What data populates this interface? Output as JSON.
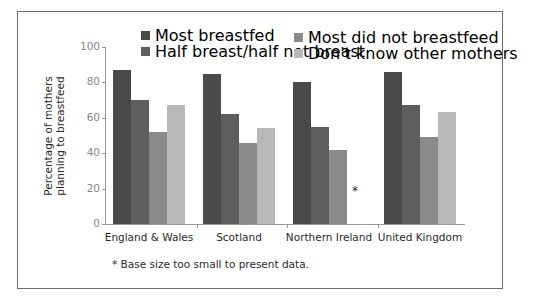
{
  "chart_data": {
    "type": "bar",
    "title": "",
    "xlabel": "",
    "ylabel": "Percentage of mothers planning to breastfeed",
    "ylabel_lines": [
      "Percentage of mothers",
      "planning to breastfeed"
    ],
    "ylim": [
      0,
      100
    ],
    "yticks": [
      0,
      20,
      40,
      60,
      80,
      100
    ],
    "grid": false,
    "legend_position": "top",
    "categories": [
      "England & Wales",
      "Scotland",
      "Northern Ireland",
      "United Kingdom"
    ],
    "series": [
      {
        "name": "Most breastfed",
        "color": "#4a4a4a",
        "values": [
          87,
          85,
          80,
          86
        ]
      },
      {
        "name": "Half breast/half not breast",
        "color": "#5e5e5e",
        "values": [
          70,
          62,
          55,
          67
        ]
      },
      {
        "name": "Most did not breastfeed",
        "color": "#8a8a8a",
        "values": [
          52,
          46,
          42,
          49
        ]
      },
      {
        "name": "Don't know other mothers",
        "color": "#b8b8b8",
        "values": [
          67,
          54,
          null,
          63
        ]
      }
    ],
    "annotations": [
      {
        "category": "Northern Ireland",
        "series": "Don't know other mothers",
        "text": "*"
      }
    ],
    "footnote": "* Base size too small to present data."
  }
}
